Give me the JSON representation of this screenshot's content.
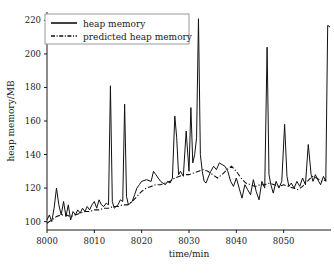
{
  "chart_data": {
    "type": "line",
    "title": "",
    "xlabel": "time/min",
    "ylabel": "heap memory/MB",
    "xlim": [
      8000,
      8060
    ],
    "ylim": [
      95,
      225
    ],
    "xticks": [
      8000,
      8010,
      8020,
      8030,
      8040,
      8050
    ],
    "yticks": [
      100,
      120,
      140,
      160,
      180,
      200,
      220
    ],
    "grid": false,
    "legend_position": "top-left",
    "legend": [
      "heap memory",
      "predicted heap memory"
    ],
    "series": [
      {
        "name": "heap memory",
        "style": "solid",
        "color": "#111111",
        "x": [
          8000.0,
          8000.5,
          8001.0,
          8001.5,
          8002.0,
          8002.5,
          8003.0,
          8003.5,
          8004.0,
          8004.5,
          8005.0,
          8005.5,
          8006.0,
          8006.5,
          8007.0,
          8007.5,
          8008.0,
          8008.5,
          8009.0,
          8009.5,
          8010.0,
          8010.5,
          8011.0,
          8011.5,
          8012.0,
          8012.5,
          8013.0,
          8013.4,
          8013.8,
          8014.2,
          8015.0,
          8015.5,
          8016.0,
          8016.4,
          8016.8,
          8017.2,
          8018.0,
          8018.5,
          8019.0,
          8019.5,
          8020.0,
          8021.0,
          8022.0,
          8022.5,
          8023.0,
          8023.5,
          8024.0,
          8024.5,
          8025.0,
          8025.5,
          8026.0,
          8026.5,
          8027.0,
          8027.4,
          8027.8,
          8028.2,
          8028.8,
          8029.4,
          8030.0,
          8030.4,
          8030.8,
          8031.2,
          8031.6,
          8032.0,
          8032.4,
          8032.8,
          8033.2,
          8033.6,
          8034.0,
          8034.6,
          8035.2,
          8035.8,
          8036.4,
          8037.0,
          8037.6,
          8038.2,
          8038.8,
          8039.4,
          8040.0,
          8040.6,
          8041.2,
          8041.8,
          8042.4,
          8043.0,
          8043.6,
          8044.2,
          8044.8,
          8045.4,
          8046.0,
          8046.5,
          8046.9,
          8047.3,
          8047.8,
          8048.4,
          8049.0,
          8049.6,
          8050.2,
          8050.7,
          8051.1,
          8051.6,
          8052.2,
          8052.8,
          8053.4,
          8054.0,
          8054.6,
          8055.2,
          8055.8,
          8056.2,
          8056.7,
          8057.2,
          8057.8,
          8058.4,
          8058.9,
          8059.3,
          8059.8
        ],
        "y": [
          101,
          104,
          100,
          108,
          120,
          110,
          104,
          112,
          103,
          110,
          101,
          106,
          104,
          107,
          105,
          108,
          106,
          109,
          107,
          110,
          112,
          108,
          113,
          110,
          109,
          111,
          110,
          181,
          112,
          108,
          110,
          113,
          112,
          170,
          115,
          110,
          112,
          116,
          120,
          122,
          124,
          125,
          124,
          130,
          128,
          126,
          124,
          123,
          122,
          124,
          123,
          126,
          163,
          150,
          128,
          130,
          127,
          154,
          130,
          168,
          135,
          140,
          150,
          221,
          140,
          130,
          124,
          123,
          126,
          130,
          133,
          131,
          135,
          134,
          133,
          130,
          124,
          121,
          126,
          120,
          114,
          122,
          119,
          116,
          125,
          118,
          113,
          124,
          120,
          204,
          128,
          122,
          117,
          124,
          120,
          124,
          158,
          127,
          121,
          123,
          120,
          124,
          121,
          126,
          122,
          146,
          128,
          124,
          128,
          125,
          122,
          127,
          124,
          217,
          216
        ],
        "peaks": [
          {
            "x": 8013.4,
            "y": 181
          },
          {
            "x": 8016.4,
            "y": 170
          },
          {
            "x": 8027.0,
            "y": 163
          },
          {
            "x": 8029.4,
            "y": 154
          },
          {
            "x": 8030.4,
            "y": 168
          },
          {
            "x": 8032.0,
            "y": 221
          },
          {
            "x": 8046.5,
            "y": 204
          },
          {
            "x": 8050.2,
            "y": 158
          },
          {
            "x": 8055.2,
            "y": 146
          },
          {
            "x": 8059.3,
            "y": 217
          }
        ]
      },
      {
        "name": "predicted heap memory",
        "style": "dash-dot",
        "color": "#111111",
        "x": [
          8000.0,
          8001.0,
          8002.0,
          8003.0,
          8004.0,
          8005.0,
          8006.0,
          8007.0,
          8008.0,
          8009.0,
          8010.0,
          8011.0,
          8012.0,
          8013.0,
          8014.0,
          8015.0,
          8016.0,
          8017.0,
          8018.0,
          8019.0,
          8020.0,
          8021.0,
          8022.0,
          8023.0,
          8024.0,
          8025.0,
          8026.0,
          8027.0,
          8028.0,
          8029.0,
          8030.0,
          8031.0,
          8032.0,
          8033.0,
          8034.0,
          8035.0,
          8036.0,
          8037.0,
          8038.0,
          8039.0,
          8040.0,
          8041.0,
          8042.0,
          8043.0,
          8044.0,
          8045.0,
          8046.0,
          8047.0,
          8048.0,
          8049.0,
          8050.0,
          8051.0,
          8052.0,
          8053.0,
          8054.0,
          8055.0,
          8056.0,
          8057.0,
          8058.0,
          8059.0
        ],
        "y": [
          99,
          101,
          103,
          104,
          104,
          103,
          104,
          105,
          106,
          106,
          107,
          107,
          108,
          108,
          109,
          109,
          110,
          110,
          112,
          115,
          118,
          120,
          121,
          122,
          122,
          123,
          124,
          126,
          127,
          128,
          128,
          129,
          130,
          131,
          130,
          128,
          126,
          128,
          131,
          133,
          130,
          126,
          123,
          122,
          121,
          122,
          122,
          123,
          122,
          121,
          122,
          121,
          120,
          119,
          121,
          124,
          127,
          126,
          124,
          125
        ]
      }
    ]
  }
}
